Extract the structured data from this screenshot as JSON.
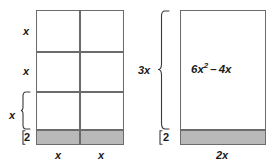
{
  "figure": {
    "type": "area-model-diagram",
    "colors": {
      "stroke": "#6b6b6b",
      "shaded_fill": "#b9b9b9",
      "unshaded_fill": "#ffffff",
      "text": "#1a1a1a"
    }
  },
  "left_model": {
    "name": "partitioned-grid-model",
    "columns": 2,
    "rows": 3,
    "row_labels": [
      "x",
      "x",
      "x"
    ],
    "column_labels": [
      "x",
      "x"
    ],
    "shaded_strip_label": "2",
    "shaded_rows": 1
  },
  "right_model": {
    "name": "combined-rectangle-model",
    "height_label": "3x",
    "shaded_strip_label": "2",
    "width_label": "2x",
    "area_expression": {
      "coefficient": "6",
      "variable": "x",
      "exponent": "2",
      "operator": "–",
      "second_term": "4x",
      "full_text": "6x2 – 4x"
    }
  }
}
